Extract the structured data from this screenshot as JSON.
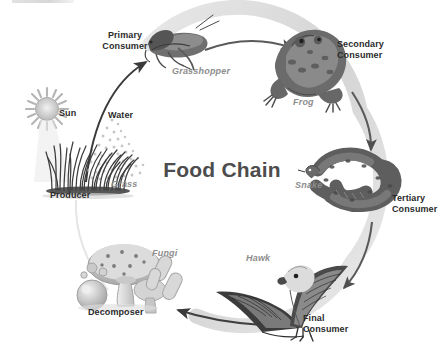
{
  "diagram": {
    "title": "Food Chain",
    "type": "cycle-diagram",
    "palette": {
      "ring": "#d9d9d9",
      "arrow": "#5d5d5d",
      "text": "#2b2b2b",
      "species_text": "#8d8d8d",
      "title_text": "#4c4c4c",
      "background": "#ffffff"
    },
    "roles": [
      {
        "key": "producer",
        "label": "Producer",
        "species": "Grass"
      },
      {
        "key": "primary_consumer",
        "label": "Primary\nConsumer",
        "species": "Grasshopper"
      },
      {
        "key": "secondary_consumer",
        "label": "Secondary\nConsumer",
        "species": "Frog"
      },
      {
        "key": "tertiary_consumer",
        "label": "Tertiary\nConsumer",
        "species": "Snake"
      },
      {
        "key": "final_consumer",
        "label": "Final\nConsumer",
        "species": "Hawk"
      },
      {
        "key": "decomposer",
        "label": "Decomposer",
        "species": "Fungi"
      }
    ],
    "inputs": [
      {
        "key": "sun",
        "label": "Sun"
      },
      {
        "key": "water",
        "label": "Water"
      }
    ],
    "labels": {
      "primary_consumer": "Primary\nConsumer",
      "secondary_consumer": "Secondary\nConsumer",
      "tertiary_consumer": "Tertiary\nConsumer",
      "final_consumer": "Final\nConsumer",
      "producer": "Producer",
      "decomposer": "Decomposer",
      "sun": "Sun",
      "water": "Water",
      "grasshopper": "Grasshopper",
      "frog": "Frog",
      "snake": "Snake",
      "hawk": "Hawk",
      "grass": "Grass",
      "fungi": "Fungi"
    }
  }
}
